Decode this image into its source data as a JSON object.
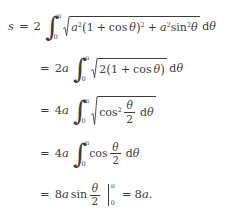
{
  "document": {
    "type": "math-derivation",
    "subject": "arc-length-of-cardioid",
    "background_color": "#ffffff",
    "text_color": "#3c3c3c",
    "line_count": 5
  },
  "symbols": {
    "integral": "∫",
    "radical": "√",
    "pi": "π",
    "theta": "θ",
    "equals": "=",
    "plus": "+",
    "zero": "0",
    "two": "2",
    "superscript_two": "2",
    "open_paren": "(",
    "close_paren": ")",
    "period": "."
  },
  "lines": [
    {
      "id": "line-1",
      "lhs": "s",
      "equals": "=",
      "coefficient": "2",
      "integral": {
        "lower": "0",
        "upper": "π"
      },
      "radicand": "a²(1 + cos θ)² + a²sin²θ",
      "differential": "dθ",
      "tokens": {
        "coef": "2",
        "a": "a",
        "exp": "2",
        "open": "(",
        "one": "1",
        "plus": "+",
        "cos": "cos",
        "theta": "θ",
        "close": ")",
        "close_exp": "2",
        "plus2": "+",
        "a2": "a",
        "a2_exp": "2",
        "sin": "sin",
        "sin_exp": "2",
        "theta2": "θ",
        "d": "d",
        "dtheta": "θ"
      }
    },
    {
      "id": "line-2",
      "equals": "=",
      "coefficient": "2a",
      "integral": {
        "lower": "0",
        "upper": "π"
      },
      "radicand": "2(1 + cos θ)",
      "differential": "dθ",
      "tokens": {
        "coef_num": "2",
        "coef_var": "a",
        "two": "2",
        "open": "(",
        "one": "1",
        "plus": "+",
        "cos": "cos",
        "theta": "θ",
        "close": ")",
        "d": "d",
        "dtheta": "θ"
      }
    },
    {
      "id": "line-3",
      "equals": "=",
      "coefficient": "4a",
      "integral": {
        "lower": "0",
        "upper": "π"
      },
      "radicand": "cos² θ/2",
      "differential": "dθ",
      "tokens": {
        "coef_num": "4",
        "coef_var": "a",
        "cos": "cos",
        "cos_exp": "2",
        "frac_num": "θ",
        "frac_den": "2",
        "d": "d",
        "dtheta": "θ"
      }
    },
    {
      "id": "line-4",
      "equals": "=",
      "coefficient": "4a",
      "integral": {
        "lower": "0",
        "upper": "π"
      },
      "integrand": "cos θ/2",
      "differential": "dθ",
      "tokens": {
        "coef_num": "4",
        "coef_var": "a",
        "cos": "cos",
        "frac_num": "θ",
        "frac_den": "2",
        "d": "d",
        "dtheta": "θ"
      }
    },
    {
      "id": "line-5",
      "equals": "=",
      "expression": "8a sin θ/2",
      "eval_limits": {
        "lower": "0",
        "upper": "π"
      },
      "result": "8a.",
      "tokens": {
        "coef_num": "8",
        "coef_var": "a",
        "sin": "sin",
        "frac_num": "θ",
        "frac_den": "2",
        "eval_lower": "0",
        "eval_upper": "π",
        "result_equals": "=",
        "result_num": "8",
        "result_var": "a",
        "result_period": "."
      }
    }
  ]
}
